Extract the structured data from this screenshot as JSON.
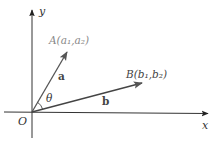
{
  "diagram": {
    "type": "vector-angle-diagram",
    "axes": {
      "x_label": "x",
      "y_label": "y",
      "origin_label": "O"
    },
    "vectors": [
      {
        "name": "a",
        "label": "a",
        "point_label": "A(a₁,a₂)"
      },
      {
        "name": "b",
        "label": "b",
        "point_label": "B(b₁,b₂)"
      }
    ],
    "angle": {
      "label": "θ",
      "between": [
        "a",
        "b"
      ]
    },
    "colors": {
      "axis": "#333333",
      "vector": "#555555",
      "label_a": "#888888",
      "label_b": "#444444",
      "text": "#333333"
    }
  }
}
